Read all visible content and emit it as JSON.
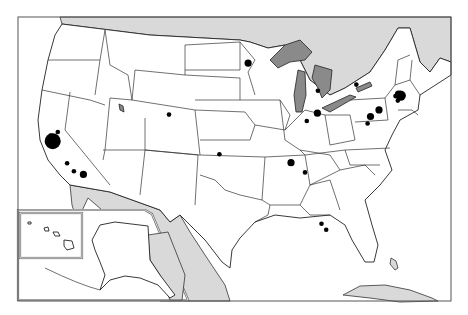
{
  "map": {
    "title": "",
    "region": "United States",
    "colors": {
      "land": "#ffffff",
      "foreign_land": "#d9d9d9",
      "lakes": "#8a8a8a",
      "borders": "#222222",
      "markers": "#000000"
    },
    "insets": [
      "Hawaii",
      "Alaska"
    ],
    "markers": [
      {
        "name": "San Francisco Bay Area",
        "state": "CA",
        "size": "very-large",
        "lon": -122.4,
        "lat": 37.7
      },
      {
        "name": "Sacramento",
        "state": "CA",
        "size": "small",
        "lon": -121.5,
        "lat": 38.6
      },
      {
        "name": "Northern CA coast",
        "state": "CA",
        "size": "small",
        "lon": -122.6,
        "lat": 38.3
      },
      {
        "name": "Central CA coast 1",
        "state": "CA",
        "size": "small",
        "lon": -120.6,
        "lat": 35.3
      },
      {
        "name": "Central CA coast 2",
        "state": "CA",
        "size": "small",
        "lon": -119.7,
        "lat": 34.4
      },
      {
        "name": "Los Angeles",
        "state": "CA",
        "size": "medium",
        "lon": -118.3,
        "lat": 34.0
      },
      {
        "name": "Denver",
        "state": "CO",
        "size": "small",
        "lon": -104.9,
        "lat": 39.7
      },
      {
        "name": "Minneapolis",
        "state": "MN",
        "size": "medium",
        "lon": -93.3,
        "lat": 44.98
      },
      {
        "name": "Detroit",
        "state": "MI",
        "size": "small",
        "lon": -83.1,
        "lat": 42.3
      },
      {
        "name": "Columbus",
        "state": "OH",
        "size": "medium",
        "lon": -83.0,
        "lat": 39.96
      },
      {
        "name": "Cincinnati",
        "state": "OH",
        "size": "small",
        "lon": -84.5,
        "lat": 39.1
      },
      {
        "name": "Rochester",
        "state": "NY",
        "size": "small",
        "lon": -77.6,
        "lat": 43.15
      },
      {
        "name": "Boston",
        "state": "MA",
        "size": "large",
        "lon": -71.06,
        "lat": 42.36
      },
      {
        "name": "Cambridge",
        "state": "MA",
        "size": "medium",
        "lon": -71.4,
        "lat": 42.5
      },
      {
        "name": "Worcester",
        "state": "MA",
        "size": "small",
        "lon": -71.8,
        "lat": 42.26
      },
      {
        "name": "Providence",
        "state": "RI",
        "size": "small",
        "lon": -71.4,
        "lat": 41.82
      },
      {
        "name": "New York",
        "state": "NY",
        "size": "medium",
        "lon": -74.0,
        "lat": 40.7
      },
      {
        "name": "Philadelphia",
        "state": "PA",
        "size": "medium",
        "lon": -75.16,
        "lat": 39.95
      },
      {
        "name": "Baltimore/Delaware",
        "state": "MD",
        "size": "small",
        "lon": -75.5,
        "lat": 39.2
      },
      {
        "name": "Oklahoma City",
        "state": "OK",
        "size": "small",
        "lon": -97.5,
        "lat": 35.47
      },
      {
        "name": "Huntsville",
        "state": "AL",
        "size": "medium",
        "lon": -86.6,
        "lat": 34.7
      },
      {
        "name": "Atlanta",
        "state": "GA",
        "size": "small",
        "lon": -84.4,
        "lat": 33.75
      },
      {
        "name": "Orlando",
        "state": "FL",
        "size": "small",
        "lon": -81.4,
        "lat": 28.5
      },
      {
        "name": "Melbourne/Palm Bay",
        "state": "FL",
        "size": "small",
        "lon": -80.6,
        "lat": 27.9
      }
    ]
  }
}
